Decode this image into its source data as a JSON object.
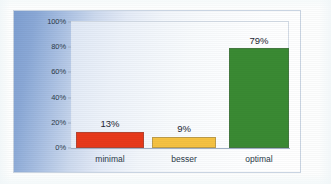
{
  "chart_data": {
    "type": "bar",
    "title": "",
    "subtitle": "",
    "xlabel": "",
    "ylabel": "",
    "categories": [
      "minimal",
      "besser",
      "optimal"
    ],
    "values": [
      13,
      9,
      79
    ],
    "data_labels": [
      "13%",
      "9%",
      "79%"
    ],
    "bar_colors": [
      "#E8391B",
      "#F5C242",
      "#3A8A33"
    ],
    "ylim": [
      0,
      100
    ],
    "ytick_values": [
      0,
      20,
      40,
      60,
      80,
      100
    ],
    "ytick_labels": [
      "0%",
      "20%",
      "40%",
      "60%",
      "80%",
      "100%"
    ],
    "grid": false,
    "legend": "none",
    "legend_position": "none",
    "annotations": []
  },
  "style": {
    "plot_background": "#ffffff",
    "frame_gradient_start": "#7e9fd1",
    "frame_gradient_end": "#ffffff",
    "axis_color": "#9fafc4",
    "text_color": "#2b3a4a"
  }
}
